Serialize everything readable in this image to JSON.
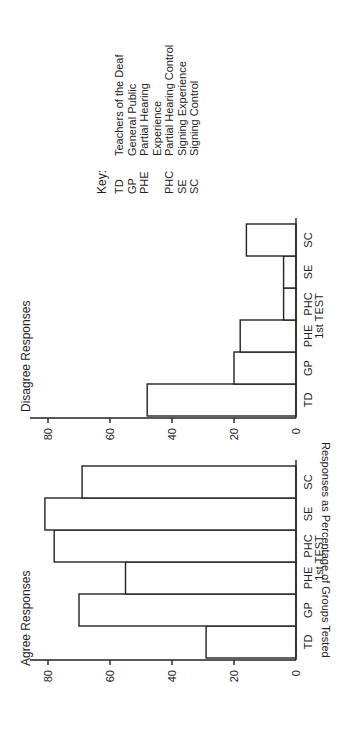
{
  "chart_data": [
    {
      "type": "bar",
      "title": "Agree Responses",
      "xlabel": "1st TEST",
      "ylabel": "Responses as Percentage of Groups Tested",
      "categories": [
        "TD",
        "GP",
        "PHE",
        "PHC",
        "SE",
        "SC"
      ],
      "values": [
        29,
        70,
        55,
        78,
        81,
        69
      ],
      "ylim": [
        0,
        85
      ],
      "yticks": [
        0,
        20,
        40,
        60,
        80
      ],
      "grid": false
    },
    {
      "type": "bar",
      "title": "Disagree Responses",
      "xlabel": "1st TEST",
      "ylabel": "",
      "categories": [
        "TD",
        "GP",
        "PHE",
        "PHC",
        "SE",
        "SC"
      ],
      "values": [
        48,
        20,
        18,
        4,
        4,
        16
      ],
      "ylim": [
        0,
        85
      ],
      "yticks": [
        0,
        20,
        40,
        60,
        80
      ],
      "grid": false
    }
  ],
  "figure": {
    "rotation": "90deg counterclockwise",
    "agree_title": "Agree Responses",
    "disagree_title": "Disagree Responses",
    "y_axis_label": "Responses as Percentage of Groups Tested",
    "x_axis_sublabel": "1st TEST",
    "tick_labels": [
      "0",
      "20",
      "40",
      "60",
      "80"
    ],
    "categories": [
      "TD",
      "GP",
      "PHE",
      "PHC",
      "SE",
      "SC"
    ]
  },
  "key": {
    "title": "Key:",
    "entries": [
      {
        "abbr": "TD",
        "label": "Teachers of the Deaf"
      },
      {
        "abbr": "GP",
        "label": "General Public"
      },
      {
        "abbr": "PHE",
        "label": "Partial Hearing"
      },
      {
        "abbr": "",
        "label": "Experience"
      },
      {
        "abbr": "PHC",
        "label": "Partial Hearing Control"
      },
      {
        "abbr": "SE",
        "label": "Signing Experience"
      },
      {
        "abbr": "SC",
        "label": "Signing Control"
      }
    ]
  }
}
